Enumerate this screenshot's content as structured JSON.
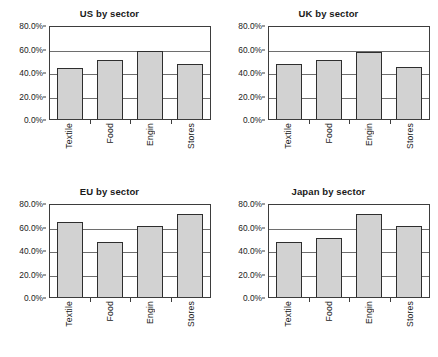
{
  "figure": {
    "background": "#ffffff",
    "bar_fill": "#d2d2d2",
    "bar_border": "#2e2e2e",
    "axis_color": "#3d3d3d",
    "grid_color": "#6e6e6e"
  },
  "chart_data": [
    {
      "type": "bar",
      "title": "US by sector",
      "categories": [
        "Textile",
        "Food",
        "Engin",
        "Stores"
      ],
      "values": [
        43.5,
        50.5,
        57.5,
        47.0
      ],
      "tick_labels": [
        "0.0%",
        "20.0%",
        "40.0%",
        "60.0%",
        "80.0%"
      ],
      "ticks": [
        0,
        20,
        40,
        60,
        80
      ],
      "xlabel": "",
      "ylabel": "",
      "ylim": [
        0,
        80
      ],
      "grid": true,
      "legend": "none"
    },
    {
      "type": "bar",
      "title": "UK by sector",
      "categories": [
        "Textile",
        "Food",
        "Engin",
        "Stores"
      ],
      "values": [
        46.5,
        50.5,
        57.0,
        44.0
      ],
      "tick_labels": [
        "0.0%",
        "20.0%",
        "40.0%",
        "60.0%",
        "80.0%"
      ],
      "ticks": [
        0,
        20,
        40,
        60,
        80
      ],
      "xlabel": "",
      "ylabel": "",
      "ylim": [
        0,
        80
      ],
      "grid": true,
      "legend": "none"
    },
    {
      "type": "bar",
      "title": "EU by sector",
      "categories": [
        "Textile",
        "Food",
        "Engin",
        "Stores"
      ],
      "values": [
        63.5,
        47.0,
        60.5,
        71.0
      ],
      "tick_labels": [
        "0.0%",
        "20.0%",
        "40.0%",
        "60.0%",
        "80.0%"
      ],
      "ticks": [
        0,
        20,
        40,
        60,
        80
      ],
      "xlabel": "",
      "ylabel": "",
      "ylim": [
        0,
        80
      ],
      "grid": true,
      "legend": "none"
    },
    {
      "type": "bar",
      "title": "Japan by sector",
      "categories": [
        "Textile",
        "Food",
        "Engin",
        "Stores"
      ],
      "values": [
        46.5,
        50.5,
        70.5,
        60.5
      ],
      "tick_labels": [
        "0.0%",
        "20.0%",
        "40.0%",
        "60.0%",
        "80.0%"
      ],
      "ticks": [
        0,
        20,
        40,
        60,
        80
      ],
      "xlabel": "",
      "ylabel": "",
      "ylim": [
        0,
        80
      ],
      "grid": true,
      "legend": "none"
    }
  ]
}
